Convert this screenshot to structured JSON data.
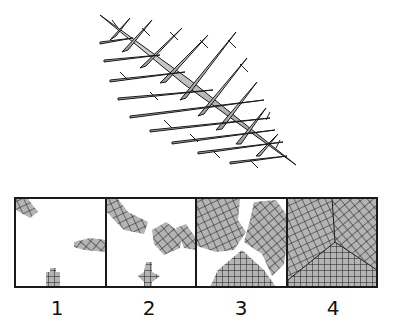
{
  "figure": {
    "top_illustration": "dendritic-crystal",
    "panels": [
      {
        "label": "1",
        "stage": "isolated small nuclei"
      },
      {
        "label": "2",
        "stage": "growing grains"
      },
      {
        "label": "3",
        "stage": "large grains nearly impinging"
      },
      {
        "label": "4",
        "stage": "fully solidified grains with boundaries"
      }
    ],
    "colors": {
      "grain_fill": "#b4b4b4",
      "line": "#1a1a1a",
      "background": "#ffffff"
    }
  }
}
